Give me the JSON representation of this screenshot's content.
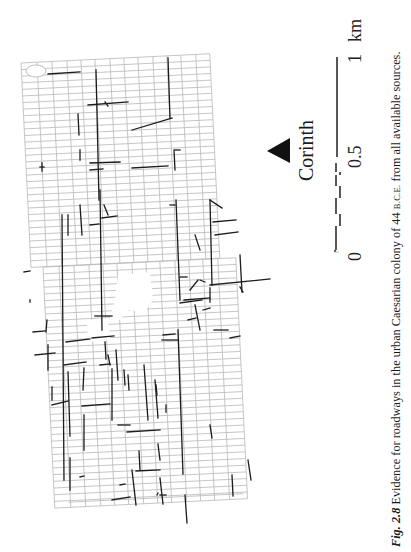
{
  "figure": {
    "number": "Fig. 2.8",
    "caption_text": " Evidence for roadways in the urban Caesarian colony of 44 ",
    "era": "B.C.E.",
    "caption_tail": " from all available sources."
  },
  "map": {
    "city_label": "Corinth",
    "north_marker": "triangle-icon",
    "colors": {
      "grid": "#b9b9b9",
      "road": "#1c1c1c",
      "background": "#ffffff"
    },
    "grid": {
      "origin": [
        21,
        63
      ],
      "angle_deg": -2.8,
      "col_widths": [
        16,
        15,
        15,
        14,
        14,
        15,
        14,
        14,
        15,
        14,
        14,
        15,
        14
      ],
      "row_height": 6.6,
      "rows_upper": 58,
      "lower_offset": 12,
      "lower_rows": 66
    },
    "roads": [
      [
        48,
        74,
        80,
        72
      ],
      [
        96,
        70,
        99,
        200
      ],
      [
        100,
        190,
        102,
        330
      ],
      [
        168,
        58,
        170,
        118
      ],
      [
        132,
        130,
        172,
        118
      ],
      [
        88,
        105,
        128,
        102
      ],
      [
        105,
        102,
        108,
        106
      ],
      [
        78,
        114,
        79,
        135
      ],
      [
        80,
        150,
        80,
        160
      ],
      [
        40,
        167,
        44,
        167
      ],
      [
        42,
        163,
        42,
        171
      ],
      [
        90,
        163,
        120,
        162
      ],
      [
        90,
        170,
        103,
        169
      ],
      [
        132,
        168,
        168,
        166
      ],
      [
        175,
        150,
        180,
        150
      ],
      [
        174,
        150,
        175,
        170
      ],
      [
        62,
        215,
        64,
        480
      ],
      [
        68,
        215,
        68,
        235
      ],
      [
        80,
        205,
        82,
        235
      ],
      [
        104,
        205,
        108,
        215
      ],
      [
        176,
        200,
        180,
        300
      ],
      [
        170,
        205,
        175,
        205
      ],
      [
        210,
        200,
        212,
        285
      ],
      [
        210,
        285,
        270,
        279
      ],
      [
        240,
        255,
        242,
        292
      ],
      [
        195,
        235,
        200,
        250
      ],
      [
        210,
        200,
        222,
        208
      ],
      [
        215,
        235,
        238,
        232
      ],
      [
        102,
        218,
        117,
        216
      ],
      [
        90,
        225,
        99,
        224
      ],
      [
        178,
        330,
        183,
        474
      ],
      [
        190,
        290,
        198,
        280
      ],
      [
        180,
        277,
        187,
        277
      ],
      [
        184,
        300,
        210,
        298
      ],
      [
        180,
        303,
        202,
        300
      ],
      [
        188,
        320,
        196,
        318
      ],
      [
        203,
        310,
        210,
        308
      ],
      [
        200,
        280,
        205,
        282
      ],
      [
        195,
        305,
        200,
        330
      ],
      [
        210,
        288,
        210,
        302
      ],
      [
        163,
        335,
        175,
        334
      ],
      [
        162,
        340,
        178,
        340
      ],
      [
        230,
        338,
        240,
        336
      ],
      [
        214,
        330,
        228,
        330
      ],
      [
        33,
        332,
        45,
        331
      ],
      [
        66,
        342,
        90,
        339
      ],
      [
        92,
        338,
        114,
        336
      ],
      [
        105,
        342,
        106,
        359
      ],
      [
        95,
        316,
        112,
        316
      ],
      [
        30,
        300,
        30,
        302
      ],
      [
        47,
        320,
        46,
        332
      ],
      [
        64,
        365,
        86,
        362
      ],
      [
        100,
        365,
        110,
        364
      ],
      [
        84,
        368,
        83,
        390
      ],
      [
        112,
        369,
        112,
        420
      ],
      [
        48,
        345,
        48,
        370
      ],
      [
        35,
        355,
        55,
        353
      ],
      [
        52,
        387,
        52,
        400
      ],
      [
        52,
        405,
        68,
        401
      ],
      [
        68,
        372,
        70,
        436
      ],
      [
        82,
        406,
        110,
        404
      ],
      [
        84,
        415,
        84,
        450
      ],
      [
        108,
        355,
        110,
        365
      ],
      [
        116,
        350,
        118,
        380
      ],
      [
        124,
        370,
        125,
        385
      ],
      [
        128,
        375,
        129,
        390
      ],
      [
        144,
        365,
        148,
        420
      ],
      [
        118,
        425,
        130,
        425
      ],
      [
        127,
        432,
        160,
        430
      ],
      [
        132,
        470,
        136,
        505
      ],
      [
        155,
        380,
        158,
        418
      ],
      [
        160,
        495,
        166,
        495
      ],
      [
        160,
        478,
        163,
        504
      ],
      [
        70,
        458,
        70,
        490
      ],
      [
        80,
        477,
        84,
        476
      ],
      [
        120,
        485,
        125,
        484
      ],
      [
        112,
        500,
        130,
        497
      ],
      [
        136,
        471,
        160,
        470
      ],
      [
        139,
        451,
        140,
        470
      ],
      [
        158,
        444,
        160,
        460
      ],
      [
        185,
        495,
        187,
        523
      ],
      [
        157,
        495,
        158,
        493
      ],
      [
        210,
        425,
        212,
        438
      ],
      [
        232,
        475,
        233,
        496
      ],
      [
        248,
        460,
        251,
        480
      ],
      [
        166,
        405,
        166,
        412
      ],
      [
        156,
        385,
        157,
        395
      ],
      [
        24,
        272,
        30,
        271
      ],
      [
        240,
        287,
        243,
        292
      ],
      [
        213,
        222,
        236,
        220
      ]
    ],
    "plazas": [
      {
        "name": "forum",
        "points": [
          [
            118,
            275
          ],
          [
            150,
            272
          ],
          [
            153,
            300
          ],
          [
            145,
            312
          ],
          [
            128,
            310
          ],
          [
            120,
            320
          ],
          [
            110,
            318
          ],
          [
            115,
            300
          ]
        ]
      },
      {
        "name": "gap-block",
        "points": [
          [
            87,
            320
          ],
          [
            108,
            318
          ],
          [
            110,
            340
          ],
          [
            88,
            342
          ]
        ]
      },
      {
        "name": "ellipse",
        "cx": 36,
        "cy": 71,
        "rx": 10,
        "ry": 6
      }
    ],
    "scale_bar": {
      "labels": {
        "zero": "0",
        "half": "0.5",
        "one": "1",
        "unit": "km"
      },
      "solid_segment": [
        [
          337,
          57
        ],
        [
          337,
          157
        ]
      ],
      "dashed_segments": [
        [
          [
            336,
            163
          ],
          [
            336,
            172
          ]
        ],
        [
          [
            340,
            172
          ],
          [
            340,
            175
          ]
        ],
        [
          [
            336,
            175
          ],
          [
            336,
            186
          ]
        ],
        [
          [
            340,
            186
          ],
          [
            340,
            198
          ]
        ],
        [
          [
            336,
            198
          ],
          [
            336,
            214
          ]
        ],
        [
          [
            340,
            214
          ],
          [
            340,
            226
          ]
        ],
        [
          [
            336,
            226
          ],
          [
            336,
            250
          ]
        ],
        [
          [
            335,
            250
          ],
          [
            335,
            252
          ]
        ]
      ]
    }
  }
}
